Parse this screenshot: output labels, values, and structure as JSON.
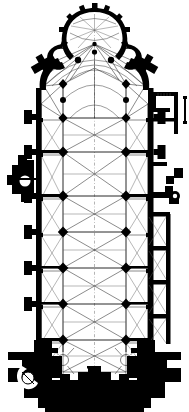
{
  "document": {
    "kind": "architectural-floor-plan",
    "subject": "Gothic cathedral ground plan",
    "orientation": "apse at top (east), west front at bottom",
    "background_color": "#ffffff",
    "ink_color": "#000000",
    "rib_color": "#2a2a2a",
    "width_px": 189,
    "height_px": 412
  },
  "plan": {
    "title": "",
    "caption": "",
    "parts": [
      {
        "id": "apse-chevet",
        "label": "Apse / chevet with radiating chapels",
        "y_range": [
          8,
          60
        ]
      },
      {
        "id": "ambulatory",
        "label": "Ambulatory",
        "y_range": [
          40,
          95
        ]
      },
      {
        "id": "choir",
        "label": "Choir",
        "y_range": [
          88,
          150
        ]
      },
      {
        "id": "transept",
        "label": "Transept",
        "y_range": [
          150,
          215
        ]
      },
      {
        "id": "nave",
        "label": "Nave",
        "y_range": [
          200,
          345
        ]
      },
      {
        "id": "side-aisles",
        "label": "Side aisles",
        "y_range": [
          95,
          350
        ]
      },
      {
        "id": "side-chapels-right",
        "label": "Lateral chapels (right)",
        "y_range": [
          215,
          345
        ]
      },
      {
        "id": "sacristy-annex",
        "label": "Sacristy annex",
        "y_range": [
          92,
          135
        ]
      },
      {
        "id": "north-chapel",
        "label": "Projecting side chapel (left)",
        "y_range": [
          158,
          205
        ]
      },
      {
        "id": "west-front",
        "label": "West front with tower piers",
        "y_range": [
          345,
          408
        ]
      },
      {
        "id": "stair-turret",
        "label": "Spiral stair turret",
        "y_range": [
          362,
          400
        ]
      }
    ],
    "bays": {
      "nave_bay_count": 6,
      "aisle_bay_count": 6,
      "chapel_count_right": 4,
      "radiating_chapel_count": 5,
      "vault_type": "quadripartite rib vault"
    },
    "axis": {
      "visible": true,
      "type": "centre-line"
    }
  },
  "geometry": {
    "piers": [
      {
        "x": 63,
        "y": 118,
        "r": 4.4
      },
      {
        "x": 126,
        "y": 118,
        "r": 4.4
      },
      {
        "x": 63,
        "y": 152,
        "r": 4.8
      },
      {
        "x": 126,
        "y": 152,
        "r": 4.8
      },
      {
        "x": 63,
        "y": 196,
        "r": 5.0
      },
      {
        "x": 126,
        "y": 196,
        "r": 5.0
      },
      {
        "x": 63,
        "y": 232,
        "r": 4.8
      },
      {
        "x": 126,
        "y": 232,
        "r": 4.8
      },
      {
        "x": 63,
        "y": 268,
        "r": 5.0
      },
      {
        "x": 126,
        "y": 268,
        "r": 5.0
      },
      {
        "x": 63,
        "y": 304,
        "r": 4.6
      },
      {
        "x": 126,
        "y": 304,
        "r": 4.6
      },
      {
        "x": 63,
        "y": 340,
        "r": 4.8
      },
      {
        "x": 126,
        "y": 340,
        "r": 4.8
      },
      {
        "x": 63,
        "y": 84,
        "r": 4.0
      },
      {
        "x": 126,
        "y": 84,
        "r": 4.0
      },
      {
        "x": 78,
        "y": 60,
        "r": 3.2
      },
      {
        "x": 111,
        "y": 60,
        "r": 3.2
      },
      {
        "x": 94,
        "y": 52,
        "r": 2.6
      }
    ],
    "left_buttresses_y": [
      120,
      155,
      199,
      235,
      271,
      307
    ],
    "right_buttresses_y": [
      120,
      155,
      199,
      235,
      271,
      307
    ],
    "walls_color": "#000000"
  },
  "legend": {
    "entries": []
  },
  "scale": {
    "text": ""
  }
}
